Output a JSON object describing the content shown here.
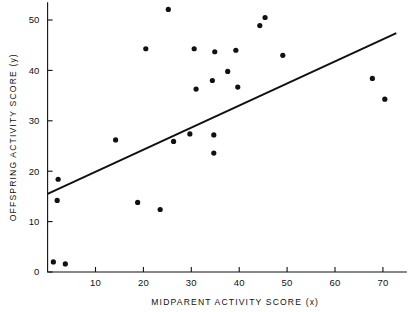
{
  "chart_data": {
    "type": "scatter",
    "title": "",
    "xlabel": "MIDPARENT ACTIVITY SCORE (x)",
    "ylabel": "OFFSPRING ACTIVITY SCORE (y)",
    "xlim": [
      0,
      75
    ],
    "ylim": [
      0,
      53.5
    ],
    "grid": false,
    "legend": null,
    "xticks": [
      10,
      20,
      30,
      40,
      50,
      60,
      70
    ],
    "xtick_labels": [
      "10",
      "20",
      "30",
      "40",
      "50",
      "60",
      "70"
    ],
    "yticks": [
      0,
      10,
      20,
      30,
      40,
      50
    ],
    "ytick_labels": [
      "0",
      "10",
      "20",
      "30",
      "40",
      "50"
    ],
    "points": [
      {
        "x": 1.2,
        "y": 2.0
      },
      {
        "x": 3.7,
        "y": 1.6
      },
      {
        "x": 2.2,
        "y": 18.4
      },
      {
        "x": 2.0,
        "y": 14.2
      },
      {
        "x": 14.2,
        "y": 26.2
      },
      {
        "x": 18.8,
        "y": 13.8
      },
      {
        "x": 20.5,
        "y": 44.3
      },
      {
        "x": 23.5,
        "y": 12.4
      },
      {
        "x": 25.2,
        "y": 52.1
      },
      {
        "x": 26.3,
        "y": 25.9
      },
      {
        "x": 29.7,
        "y": 27.4
      },
      {
        "x": 30.6,
        "y": 44.3
      },
      {
        "x": 31.0,
        "y": 36.3
      },
      {
        "x": 34.4,
        "y": 38.0
      },
      {
        "x": 34.7,
        "y": 27.2
      },
      {
        "x": 34.7,
        "y": 23.6
      },
      {
        "x": 34.9,
        "y": 43.7
      },
      {
        "x": 37.6,
        "y": 39.8
      },
      {
        "x": 39.3,
        "y": 44.0
      },
      {
        "x": 39.7,
        "y": 36.7
      },
      {
        "x": 44.3,
        "y": 48.9
      },
      {
        "x": 45.4,
        "y": 50.5
      },
      {
        "x": 49.1,
        "y": 43.0
      },
      {
        "x": 67.8,
        "y": 38.4
      },
      {
        "x": 70.4,
        "y": 34.3
      }
    ],
    "fit_line": {
      "type": "linear",
      "slope": 0.438,
      "intercept": 15.5,
      "x_start": 0,
      "x_end": 72.8,
      "y_start": 15.5,
      "y_end": 47.4
    },
    "marker_radius_px": 2.6,
    "colors": {
      "point": "#111111",
      "line": "#111111",
      "axis": "#111111",
      "background": "#ffffff"
    }
  }
}
